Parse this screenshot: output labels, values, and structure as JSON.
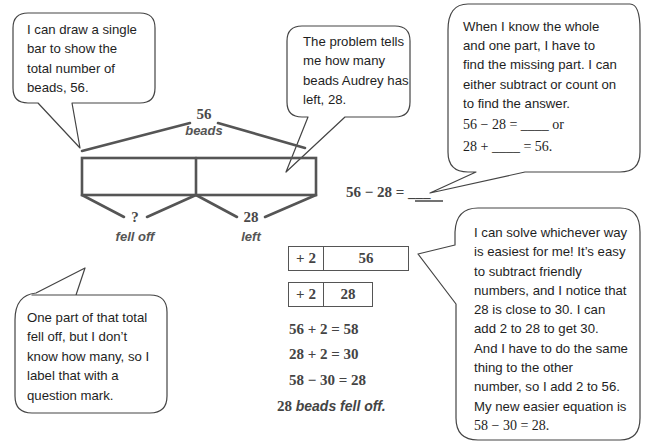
{
  "bubbles": {
    "top_left": {
      "lines": [
        "I can draw a single",
        "bar to show the",
        "total number of",
        "beads, 56."
      ]
    },
    "top_middle": {
      "lines": [
        "The problem tells",
        "me how many",
        "beads Audrey has",
        "left, 28."
      ]
    },
    "top_right": {
      "lines": [
        "When I know the whole",
        "and one part, I have to",
        "find the missing part.  I can",
        "either subtract or count on",
        "to find the answer."
      ],
      "equation_1": "56 − 28 = ____ or",
      "equation_2": "28 + ____ = 56."
    },
    "bottom_left": {
      "lines": [
        "One part of that total",
        "fell off, but I don’t",
        "know how many, so I",
        "label that with a",
        "question mark."
      ]
    },
    "bottom_right": {
      "lines": [
        "I can solve whichever way",
        "is easiest for me!  It’s easy",
        "to subtract friendly",
        "numbers, and I notice that",
        "28 is close to 30.  I can",
        "add 2 to 28 to get 30.",
        "And I have to do the same",
        "thing to the other",
        "number, so I add 2 to 56.",
        "My new easier equation is"
      ],
      "equation": "58 − 30 = 28."
    }
  },
  "bar_model": {
    "total_value": "56",
    "total_label": "beads",
    "part_unknown_value": "?",
    "part_unknown_label": "fell off",
    "part_known_value": "28",
    "part_known_label": "left"
  },
  "equation_blank": "56 − 28 = ___",
  "compensation": {
    "box_1": {
      "adjust": "+ 2",
      "value": "56"
    },
    "box_2": {
      "adjust": "+ 2",
      "value": "28"
    },
    "steps": [
      "56 + 2 = 58",
      "28 + 2 = 30",
      "58 − 30 = 28"
    ],
    "conclusion_number": "28",
    "conclusion_text": "beads fell off."
  },
  "colors": {
    "stroke": "#555555",
    "bubble_stroke": "#444444",
    "text": "#1e1e1e",
    "label_text": "#555555"
  }
}
